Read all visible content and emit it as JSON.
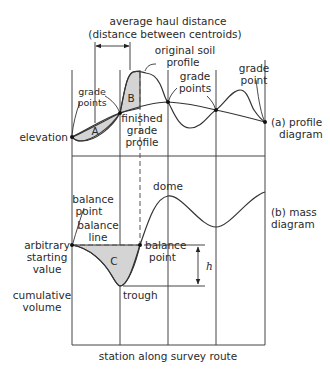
{
  "title_haul": [
    "average haul distance",
    "(distance between centroids)"
  ],
  "profile": {
    "caption": [
      "(a) profile",
      "diagram"
    ],
    "y_label": "elevation",
    "labels": {
      "original_soil": [
        "original soil",
        "profile"
      ],
      "grade_points_left": [
        "grade",
        "points"
      ],
      "grade_points_right": [
        "grade",
        "points"
      ],
      "grade_point_end": [
        "grade",
        "point"
      ],
      "finished_grade": [
        "finished",
        "grade",
        "profile"
      ],
      "area_a": "A",
      "area_b": "B"
    }
  },
  "mass": {
    "caption": [
      "(b) mass",
      "diagram"
    ],
    "y_label": [
      "cumulative",
      "volume"
    ],
    "labels": {
      "balance_point_left": [
        "balance",
        "point"
      ],
      "balance_line": [
        "balance",
        "line"
      ],
      "balance_point_right": [
        "balance",
        "point"
      ],
      "arbitrary_start": [
        "arbitrary",
        "starting",
        "value"
      ],
      "dome": "dome",
      "trough": "trough",
      "area_c": "C",
      "height": "h"
    }
  },
  "x_label": "station along survey route",
  "colors": {
    "shade": "#d4d4d4",
    "line": "#333333"
  }
}
